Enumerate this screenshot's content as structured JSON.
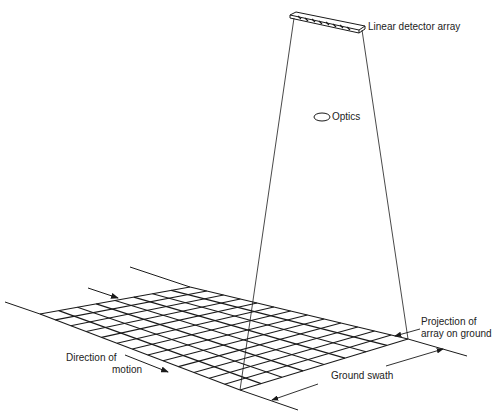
{
  "diagram": {
    "labels": {
      "detector": "Linear detector array",
      "optics": "Optics",
      "projection_line1": "Projection of",
      "projection_line2": "array on ground",
      "direction_line1": "Direction of",
      "direction_line2": "motion",
      "swath": "Ground swath"
    },
    "grid": {
      "rows": 8,
      "cols": 13,
      "corners": {
        "left": [
          40,
          314
        ],
        "back": [
          190,
          287
        ],
        "right": [
          408,
          339
        ],
        "front": [
          240,
          390
        ]
      }
    },
    "colors": {
      "line": "#1a1a1a",
      "background": "#ffffff"
    }
  }
}
